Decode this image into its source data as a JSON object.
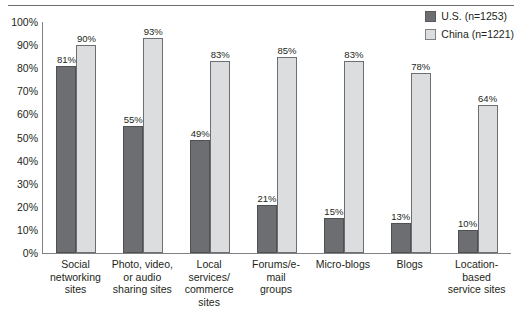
{
  "chart_data": {
    "type": "bar",
    "title": "",
    "subtitle": "",
    "xlabel": "",
    "ylabel": "",
    "ylim": [
      0,
      100
    ],
    "grid": false,
    "legend_position": "top-right",
    "categories": [
      "Social networking sites",
      "Photo, video, or audio sharing sites",
      "Local services/ commerce sites",
      "Forums/e-mail groups",
      "Micro-blogs",
      "Blogs",
      "Location-based service sites"
    ],
    "category_lines": [
      [
        "Social",
        "networking",
        "sites"
      ],
      [
        "Photo, video,",
        "or audio",
        "sharing sites"
      ],
      [
        "Local",
        "services/",
        "commerce",
        "sites"
      ],
      [
        "Forums/e-mail",
        "groups"
      ],
      [
        "Micro-blogs"
      ],
      [
        "Blogs"
      ],
      [
        "Location-based",
        "service sites"
      ]
    ],
    "series": [
      {
        "name": "U.S. (n=1253)",
        "color": "#6d6e71",
        "values": [
          81,
          55,
          49,
          21,
          15,
          13,
          10
        ],
        "labels": [
          "81%",
          "55%",
          "49%",
          "21%",
          "15%",
          "13%",
          "10%"
        ]
      },
      {
        "name": "China (n=1221)",
        "color": "#dcddde",
        "values": [
          90,
          93,
          83,
          85,
          83,
          78,
          64
        ],
        "labels": [
          "90%",
          "93%",
          "83%",
          "85%",
          "83%",
          "78%",
          "64%"
        ]
      }
    ],
    "yticks": [
      0,
      10,
      20,
      30,
      40,
      50,
      60,
      70,
      80,
      90,
      100
    ],
    "ytick_labels": [
      "0%",
      "10%",
      "20%",
      "30%",
      "40%",
      "50%",
      "60%",
      "70%",
      "80%",
      "90%",
      "100%"
    ]
  },
  "legend": {
    "items": [
      {
        "label": "U.S. (n=1253)",
        "swatch": "us-swatch",
        "color": "#6d6e71"
      },
      {
        "label": "China (n=1221)",
        "swatch": "china-swatch",
        "color": "#dcddde"
      }
    ]
  }
}
